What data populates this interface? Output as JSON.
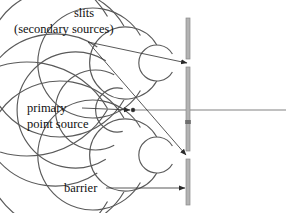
{
  "figure": {
    "width": 286,
    "height": 213,
    "background_color": "#ffffff"
  },
  "labels": {
    "slits_line1": "slits",
    "slits_line2": "(secondary sources)",
    "primary_line1": "primary",
    "primary_line2": "point source",
    "barrier": "barrier"
  },
  "colors": {
    "wave_stroke": "#5a5a5a",
    "barrier_fill": "#b3b3b3",
    "barrier_stroke": "#8a8a8a",
    "leader_stroke": "#3a3a3a",
    "axis_stroke": "#6b6b6b",
    "text": "#111111"
  },
  "geometry": {
    "primary_source": {
      "x": 133,
      "y": 110
    },
    "upper_slit": {
      "x": 188,
      "y": 63
    },
    "lower_slit": {
      "x": 188,
      "y": 155
    },
    "axis": {
      "x1": 133,
      "y1": 110,
      "x2": 286,
      "y2": 110
    },
    "barrier_x": 186,
    "barrier_width": 4,
    "barrier_top": 18,
    "barrier_bottom": 205,
    "slit_gap_height": 8,
    "left_wave_radii": [
      22,
      40,
      58,
      76
    ],
    "right_wave_radii": [
      18,
      36,
      55,
      74,
      93
    ],
    "left_wave_angle_deg": 118,
    "right_wave_angle_deg": 150
  },
  "annotations": [
    {
      "name": "slits-leader-upper",
      "from": {
        "x": 88,
        "y": 42
      },
      "to": {
        "x": 187,
        "y": 63
      }
    },
    {
      "name": "slits-leader-lower",
      "from": {
        "x": 88,
        "y": 42
      },
      "to": {
        "x": 186,
        "y": 155
      }
    },
    {
      "name": "primary-source-leader",
      "from": {
        "x": 82,
        "y": 108
      },
      "to": {
        "x": 130,
        "y": 110
      }
    },
    {
      "name": "barrier-leader",
      "from": {
        "x": 106,
        "y": 188
      },
      "to": {
        "x": 185,
        "y": 188
      }
    }
  ],
  "label_positions": {
    "slits_line1": {
      "x": 74,
      "y": 17
    },
    "slits_line2": {
      "x": 14,
      "y": 33
    },
    "primary_line1": {
      "x": 27,
      "y": 112
    },
    "primary_line2": {
      "x": 27,
      "y": 128
    },
    "barrier": {
      "x": 64,
      "y": 192
    }
  }
}
